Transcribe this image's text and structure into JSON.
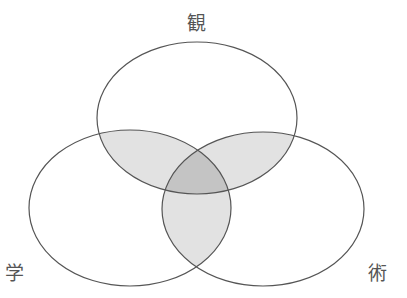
{
  "diagram": {
    "type": "venn-3",
    "sets": [
      {
        "id": "top",
        "label": "観",
        "cx": 197,
        "cy": 118,
        "rx": 100,
        "ry": 76
      },
      {
        "id": "left",
        "label": "学",
        "cx": 130,
        "cy": 208,
        "rx": 101,
        "ry": 78
      },
      {
        "id": "right",
        "label": "術",
        "cx": 263,
        "cy": 209,
        "rx": 101,
        "ry": 77
      }
    ],
    "colors": {
      "stroke": "#555555",
      "pair_fill": "#e2e2e2",
      "triple_fill": "#c4c4c4",
      "background": "#ffffff"
    }
  },
  "labels": {
    "top": "観",
    "left": "学",
    "right": "術"
  }
}
